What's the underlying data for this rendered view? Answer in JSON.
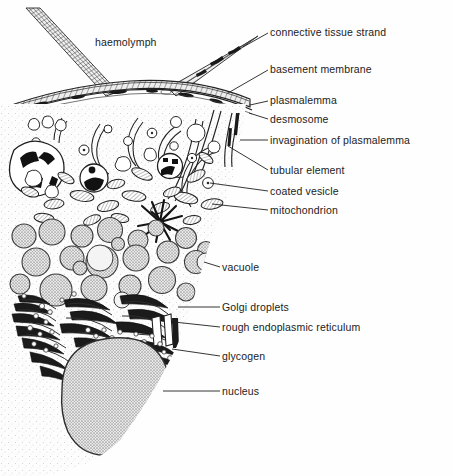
{
  "figure": {
    "title": "haemolymph",
    "colors": {
      "ink": "#1b1b1b",
      "line": "#2a2a2a",
      "cytoplasm_fill": "#fdfdfd",
      "stipple": "#9a9a9a",
      "vacuole_fill": "#c9c9c9",
      "nucleus_fill": "#bdbdbd",
      "membrane_fill": "#e2e2e2",
      "dark_organelle": "#1a1a1a",
      "background": "#fefefe"
    }
  },
  "interior_labels": [
    {
      "id": "haemolymph",
      "text": "haemolymph",
      "x": 95,
      "y": 36
    }
  ],
  "callout_labels": [
    {
      "id": "connective-tissue-strand",
      "text": "connective tissue strand",
      "x": 270,
      "y": 26,
      "leader": {
        "x1": 268,
        "y1": 33,
        "x2": 243,
        "y2": 47
      }
    },
    {
      "id": "basement-membrane",
      "text": "basement membrane",
      "x": 270,
      "y": 63,
      "leader": {
        "x1": 268,
        "y1": 70,
        "x2": 228,
        "y2": 93
      }
    },
    {
      "id": "plasmalemma",
      "text": "plasmalemma",
      "x": 270,
      "y": 94,
      "leader": {
        "x1": 268,
        "y1": 101,
        "x2": 250,
        "y2": 105
      }
    },
    {
      "id": "desmosome",
      "text": "desmosome",
      "x": 270,
      "y": 113,
      "leader": {
        "x1": 268,
        "y1": 119,
        "x2": 249,
        "y2": 113
      }
    },
    {
      "id": "invagination-of-plasmalemma",
      "text": "invagination of plasmalemma",
      "x": 270,
      "y": 134,
      "leader": {
        "x1": 268,
        "y1": 140,
        "x2": 240,
        "y2": 140
      }
    },
    {
      "id": "tubular-element",
      "text": "tubular element",
      "x": 270,
      "y": 164,
      "leader": {
        "x1": 268,
        "y1": 170,
        "x2": 228,
        "y2": 146
      }
    },
    {
      "id": "coated-vesicle",
      "text": "coated vesicle",
      "x": 270,
      "y": 185,
      "leader": {
        "x1": 268,
        "y1": 191,
        "x2": 210,
        "y2": 183
      }
    },
    {
      "id": "mitochondrion",
      "text": "mitochondrion",
      "x": 270,
      "y": 204,
      "leader": {
        "x1": 268,
        "y1": 210,
        "x2": 212,
        "y2": 204
      }
    },
    {
      "id": "vacuole",
      "text": "vacuole",
      "x": 222,
      "y": 261,
      "leader": {
        "x1": 220,
        "y1": 267,
        "x2": 204,
        "y2": 262
      }
    },
    {
      "id": "golgi-droplets",
      "text": "Golgi droplets",
      "x": 222,
      "y": 301,
      "leader": {
        "x1": 220,
        "y1": 307,
        "x2": 178,
        "y2": 307
      }
    },
    {
      "id": "rough-endoplasmic-reticulum",
      "text": "rough endoplasmic reticulum",
      "x": 222,
      "y": 321,
      "leader": {
        "x1": 220,
        "y1": 327,
        "x2": 174,
        "y2": 322
      }
    },
    {
      "id": "glycogen",
      "text": "glycogen",
      "x": 222,
      "y": 350,
      "leader": {
        "x1": 220,
        "y1": 356,
        "x2": 172,
        "y2": 349
      }
    },
    {
      "id": "nucleus",
      "text": "nucleus",
      "x": 222,
      "y": 385,
      "leader": {
        "x1": 220,
        "y1": 391,
        "x2": 163,
        "y2": 391
      }
    }
  ]
}
